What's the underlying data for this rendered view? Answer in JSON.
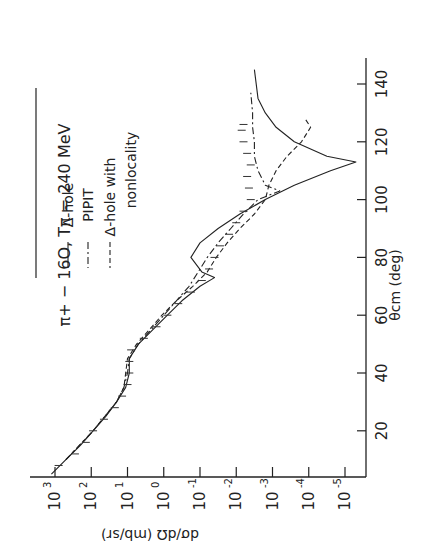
{
  "chart_data": {
    "type": "line",
    "title": "π+ − 16O, Tπ = 240 MeV",
    "xlabel": "θcm (deg)",
    "ylabel": "dσ/dΩ (mb/sr)",
    "orientation": "rotated 90° counter-clockwise",
    "x_ticks": [
      20,
      40,
      60,
      80,
      100,
      120,
      140
    ],
    "y_ticks": [
      "10^3",
      "10^2",
      "10^1",
      "10^0",
      "10^-1",
      "10^-2",
      "10^-3",
      "10^-4",
      "10^-5"
    ],
    "y_scale": "log",
    "xlim": [
      5,
      148
    ],
    "ylim": [
      1e-05,
      1000.0
    ],
    "legend": [
      {
        "label": "Δ-hole",
        "style": "solid"
      },
      {
        "label": "PIPIT",
        "style": "dash-dot"
      },
      {
        "label": "Δ-hole with nonlocality",
        "style": "dashed"
      }
    ],
    "series": [
      {
        "name": "Δ-hole",
        "style": "solid",
        "x": [
          5,
          10,
          15,
          20,
          25,
          30,
          35,
          40,
          45,
          50,
          55,
          60,
          65,
          70,
          73,
          75,
          80,
          85,
          90,
          95,
          100,
          105,
          110,
          113,
          115,
          120,
          125,
          130,
          135,
          145
        ],
        "log_y": [
          3.1,
          2.7,
          2.3,
          1.95,
          1.6,
          1.3,
          1.05,
          0.95,
          0.95,
          0.7,
          0.3,
          -0.1,
          -0.5,
          -1.0,
          -1.4,
          -1.05,
          -0.75,
          -1.0,
          -1.5,
          -2.1,
          -2.8,
          -3.6,
          -4.6,
          -5.3,
          -4.5,
          -3.6,
          -3.1,
          -2.8,
          -2.6,
          -2.5
        ]
      },
      {
        "name": "PIPIT",
        "style": "dash-dot",
        "x": [
          10,
          20,
          30,
          35,
          40,
          45,
          50,
          55,
          60,
          65,
          70,
          75,
          80,
          85,
          90,
          95,
          100,
          103,
          105,
          110,
          115,
          120,
          125,
          130,
          137
        ],
        "log_y": [
          2.7,
          1.95,
          1.3,
          1.1,
          1.0,
          0.95,
          0.7,
          0.35,
          0.0,
          -0.35,
          -0.7,
          -0.95,
          -1.2,
          -1.5,
          -1.85,
          -2.2,
          -2.6,
          -3.2,
          -2.8,
          -2.6,
          -2.5,
          -2.5,
          -2.45,
          -2.45,
          -2.4
        ]
      },
      {
        "name": "Δ-hole with nonlocality",
        "style": "dashed",
        "x": [
          10,
          20,
          30,
          35,
          40,
          45,
          50,
          55,
          60,
          65,
          70,
          75,
          80,
          85,
          90,
          95,
          100,
          105,
          110,
          115,
          120,
          125,
          128
        ],
        "log_y": [
          2.7,
          1.95,
          1.3,
          1.1,
          1.05,
          1.0,
          0.75,
          0.4,
          0.05,
          -0.35,
          -0.8,
          -1.2,
          -1.45,
          -1.75,
          -2.1,
          -2.5,
          -2.8,
          -2.9,
          -3.1,
          -3.4,
          -3.8,
          -4.05,
          -3.9
        ]
      }
    ],
    "data_points": {
      "x": [
        8,
        12,
        16,
        20,
        24,
        28,
        32,
        36,
        40,
        44,
        48,
        52,
        56,
        60,
        64,
        68,
        72,
        76,
        80,
        84,
        88,
        92,
        96,
        100,
        104,
        108,
        112,
        116,
        120,
        124,
        126
      ],
      "log_y": [
        2.9,
        2.45,
        2.15,
        1.95,
        1.65,
        1.35,
        1.15,
        1.0,
        0.95,
        0.95,
        0.9,
        0.55,
        0.2,
        -0.1,
        -0.4,
        -0.75,
        -1.05,
        -1.25,
        -1.4,
        -1.55,
        -1.8,
        -2.0,
        -2.2,
        -2.4,
        -2.35,
        -2.3,
        -2.4,
        -2.3,
        -2.2,
        -2.15,
        -2.2
      ]
    }
  }
}
